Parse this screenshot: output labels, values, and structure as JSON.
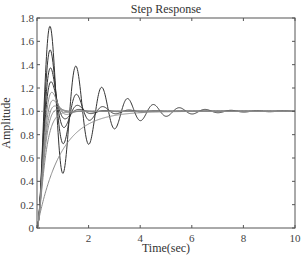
{
  "chart_data": {
    "type": "line",
    "title": "Step Response",
    "xlabel": "Time(sec)",
    "ylabel": "Amplitude",
    "xlim": [
      0,
      10
    ],
    "ylim": [
      0,
      1.8
    ],
    "xticks": [
      0,
      2,
      4,
      6,
      8,
      10
    ],
    "xtick_labels": [
      "",
      "2",
      "4",
      "6",
      "8",
      "10"
    ],
    "yticks": [
      0,
      0.2,
      0.4,
      0.6,
      0.8,
      1.0,
      1.2,
      1.4,
      1.6,
      1.8
    ],
    "ytick_labels": [
      "0",
      "0.2",
      "0.4",
      "0.6",
      "0.8",
      "1.0",
      "1.2",
      "1.4",
      "1.6",
      "1.8"
    ],
    "grid": false,
    "legend": null,
    "steady_state": 1.0,
    "natural_frequency_rad_s": 6.3,
    "series": [
      {
        "name": "zeta=0.1",
        "zeta": 0.1,
        "peak": 1.72,
        "peak_time": 0.5
      },
      {
        "name": "zeta=0.2",
        "zeta": 0.2,
        "peak": 1.52,
        "peak_time": 0.51
      },
      {
        "name": "zeta=0.3",
        "zeta": 0.3,
        "peak": 1.37,
        "peak_time": 0.52
      },
      {
        "name": "zeta=0.4",
        "zeta": 0.4,
        "peak": 1.25,
        "peak_time": 0.54
      },
      {
        "name": "zeta=0.5",
        "zeta": 0.5,
        "peak": 1.16,
        "peak_time": 0.58
      },
      {
        "name": "zeta=0.6",
        "zeta": 0.6,
        "peak": 1.09,
        "peak_time": 0.62
      },
      {
        "name": "zeta=0.7",
        "zeta": 0.7,
        "peak": 1.05,
        "peak_time": 0.7
      },
      {
        "name": "zeta=0.8",
        "zeta": 0.8,
        "peak": 1.02,
        "peak_time": 0.83
      },
      {
        "name": "zeta=1.0",
        "zeta": 1.0,
        "peak": 1.0,
        "peak_time": null
      },
      {
        "name": "first-order",
        "tau": 0.9,
        "peak": 1.0,
        "peak_time": null
      }
    ],
    "colors": {
      "axes": "#555555",
      "curve_dark": "#333333",
      "curve_light": "#8a8a8a",
      "reference": "#999999"
    }
  }
}
